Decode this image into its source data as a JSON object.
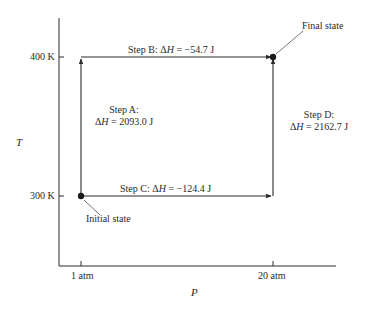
{
  "chart_data": {
    "type": "diagram",
    "title": "",
    "xlabel": "P",
    "ylabel": "T",
    "x_ticks": [
      "1 atm",
      "20 atm"
    ],
    "y_ticks": [
      "300 K",
      "400 K"
    ],
    "states": [
      {
        "name": "Initial state",
        "P": "1 atm",
        "T": "300 K"
      },
      {
        "name": "Final state",
        "P": "20 atm",
        "T": "400 K"
      }
    ],
    "steps": [
      {
        "name": "Step A",
        "from": [
          "1 atm",
          "300 K"
        ],
        "to": [
          "1 atm",
          "400 K"
        ],
        "delta_H_J": 2093.0
      },
      {
        "name": "Step B",
        "from": [
          "1 atm",
          "400 K"
        ],
        "to": [
          "20 atm",
          "400 K"
        ],
        "delta_H_J": -54.7
      },
      {
        "name": "Step C",
        "from": [
          "1 atm",
          "300 K"
        ],
        "to": [
          "20 atm",
          "300 K"
        ],
        "delta_H_J": -124.4
      },
      {
        "name": "Step D",
        "from": [
          "20 atm",
          "300 K"
        ],
        "to": [
          "20 atm",
          "400 K"
        ],
        "delta_H_J": 2162.7
      }
    ]
  },
  "axes": {
    "x_label": "P",
    "y_label": "T",
    "x_tick_1": "1 atm",
    "x_tick_2": "20 atm",
    "y_tick_1": "400 K",
    "y_tick_2": "300 K"
  },
  "labels": {
    "step_b": "Step B:  ΔH = −54.7 J",
    "step_c": "Step C:  ΔH = −124.4 J",
    "step_a_title": "Step A:",
    "step_a_value": "ΔH = 2093.0 J",
    "step_d_title": "Step D:",
    "step_d_value": "ΔH = 2162.7 J",
    "initial_state": "Initial state",
    "final_state": "Final state"
  },
  "colors": {
    "line": "#2a2a2a",
    "leader": "#666666",
    "background": "#ffffff"
  }
}
